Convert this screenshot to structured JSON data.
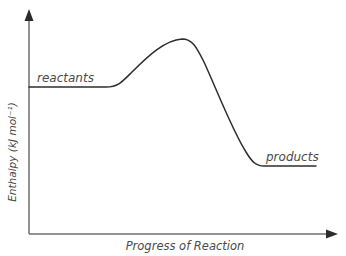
{
  "diagram": {
    "type": "energy-profile",
    "title": "",
    "y_axis_label": "Enthalpy (kJ mol⁻¹)",
    "x_axis_label": "Progress of Reaction",
    "curve_labels": {
      "reactants": "reactants",
      "products": "products"
    },
    "colors": {
      "axis": "#6e6e6e",
      "curve": "#2e2e2e",
      "text": "#4a4a4a"
    }
  }
}
